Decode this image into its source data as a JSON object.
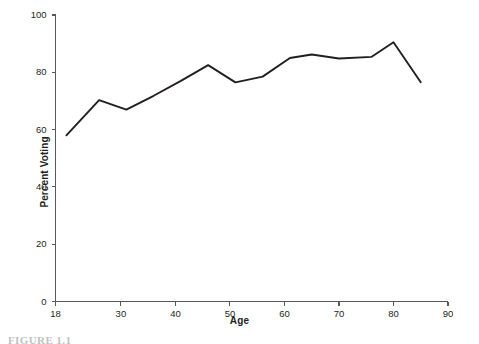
{
  "figure": {
    "caption": "FIGURE 1.1"
  },
  "chart_data": {
    "type": "line",
    "title": "",
    "subtitle": "",
    "xlabel": "Age",
    "ylabel": "Percent Voting",
    "xlim": [
      18,
      90
    ],
    "ylim": [
      0,
      100
    ],
    "grid": false,
    "legend": null,
    "legend_position": "none",
    "line_color": "#231f20",
    "axis_color": "#58595b",
    "x_ticks": [
      18,
      30,
      40,
      50,
      60,
      70,
      80,
      90
    ],
    "x_tick_labels": [
      "18",
      "30",
      "40",
      "50",
      "60",
      "70",
      "80",
      "90"
    ],
    "y_ticks": [
      0,
      20,
      40,
      60,
      80,
      100
    ],
    "y_tick_labels": [
      "0",
      "20",
      "40",
      "60",
      "80",
      "100"
    ],
    "series": [
      {
        "name": "Percent Voting",
        "x": [
          20,
          26,
          31,
          36,
          41,
          46,
          51,
          56,
          61,
          65,
          70,
          76,
          80,
          85
        ],
        "values": [
          58.0,
          70.3,
          67.0,
          71.8,
          77.0,
          82.5,
          76.5,
          78.5,
          85.0,
          86.2,
          84.8,
          85.4,
          90.5,
          76.5
        ]
      }
    ]
  }
}
